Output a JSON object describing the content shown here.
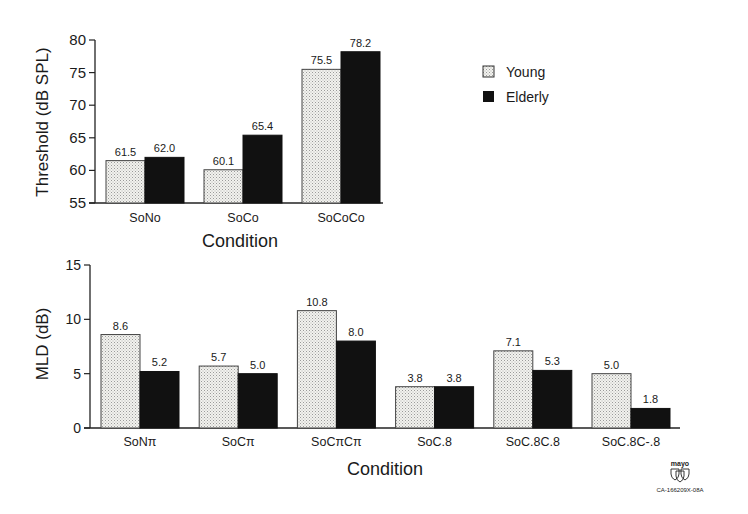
{
  "chart_data": [
    {
      "type": "bar",
      "title": "",
      "xlabel": "Condition",
      "ylabel": "Threshold (dB SPL)",
      "ylim": [
        55,
        80
      ],
      "yticks": [
        55,
        60,
        65,
        70,
        75,
        80
      ],
      "categories": [
        "SoNo",
        "SoCo",
        "SoCoCo"
      ],
      "series": [
        {
          "name": "Young",
          "values": [
            61.5,
            60.1,
            75.5
          ],
          "labels": [
            "61.5",
            "60.1",
            "75.5"
          ],
          "fill": "stippled-light"
        },
        {
          "name": "Elderly",
          "values": [
            62.0,
            65.4,
            78.2
          ],
          "labels": [
            "62.0",
            "65.4",
            "78.2"
          ],
          "fill": "#111111"
        }
      ],
      "legend": {
        "position": "right",
        "entries": [
          "Young",
          "Elderly"
        ]
      },
      "grid": false
    },
    {
      "type": "bar",
      "title": "",
      "xlabel": "Condition",
      "ylabel": "MLD (dB)",
      "ylim": [
        0,
        15
      ],
      "yticks": [
        0,
        5,
        10,
        15
      ],
      "categories": [
        "SoNπ",
        "SoCπ",
        "SoCπCπ",
        "SoC.8",
        "SoC.8C.8",
        "SoC.8C-.8"
      ],
      "series": [
        {
          "name": "Young",
          "values": [
            8.6,
            5.7,
            10.8,
            3.8,
            7.1,
            5.0
          ],
          "labels": [
            "8.6",
            "5.7",
            "10.8",
            "3.8",
            "7.1",
            "5.0"
          ],
          "fill": "stippled-light"
        },
        {
          "name": "Elderly",
          "values": [
            5.2,
            5.0,
            8.0,
            3.8,
            5.3,
            1.8
          ],
          "labels": [
            "5.2",
            "5.0",
            "8.0",
            "3.8",
            "5.3",
            "1.8"
          ],
          "fill": "#111111"
        }
      ],
      "grid": false
    }
  ],
  "logo": {
    "text": "mayo",
    "code": "CA-166209X-08A"
  },
  "colors": {
    "young_fill": "#eeeeea",
    "elderly_fill": "#111111",
    "axis": "#222222"
  }
}
